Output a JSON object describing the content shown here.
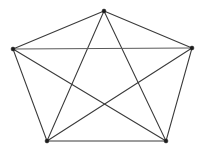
{
  "figure": {
    "type": "diagram",
    "background_color": "#ffffff",
    "edge_color": "#3a3a3a",
    "vertex_color": "#1c1c1c",
    "width": 204,
    "height": 158
  },
  "graph": {
    "name": "K5",
    "vertex_count": "5",
    "edge_count": "10",
    "vertices": [
      {
        "id": "top",
        "label": "",
        "x": 104,
        "y": 11
      },
      {
        "id": "right",
        "label": "",
        "x": 192,
        "y": 48
      },
      {
        "id": "bottom-right",
        "label": "",
        "x": 166,
        "y": 141
      },
      {
        "id": "bottom-left",
        "label": "",
        "x": 47,
        "y": 141
      },
      {
        "id": "left",
        "label": "",
        "x": 13,
        "y": 49
      }
    ],
    "edges": [
      {
        "id": "edge-top-right",
        "from": "top",
        "to": "right",
        "kind": "perimeter",
        "style": "solid"
      },
      {
        "id": "edge-right-bottomright",
        "from": "right",
        "to": "bottom-right",
        "kind": "perimeter",
        "style": "solid"
      },
      {
        "id": "edge-bottomright-bottomleft",
        "from": "bottom-right",
        "to": "bottom-left",
        "kind": "perimeter",
        "style": "solid"
      },
      {
        "id": "edge-bottomleft-left",
        "from": "bottom-left",
        "to": "left",
        "kind": "perimeter",
        "style": "solid"
      },
      {
        "id": "edge-left-top",
        "from": "left",
        "to": "top",
        "kind": "perimeter",
        "style": "solid"
      },
      {
        "id": "edge-top-bottomright",
        "from": "top",
        "to": "bottom-right",
        "kind": "diagonal",
        "style": "solid"
      },
      {
        "id": "edge-top-bottomleft",
        "from": "top",
        "to": "bottom-left",
        "kind": "diagonal",
        "style": "solid"
      },
      {
        "id": "edge-right-bottomleft",
        "from": "right",
        "to": "bottom-left",
        "kind": "diagonal",
        "style": "solid"
      },
      {
        "id": "edge-left-bottomright",
        "from": "left",
        "to": "bottom-right",
        "kind": "diagonal",
        "style": "solid"
      },
      {
        "id": "edge-left-right",
        "from": "left",
        "to": "right",
        "kind": "diagonal",
        "style": "faint"
      }
    ]
  }
}
